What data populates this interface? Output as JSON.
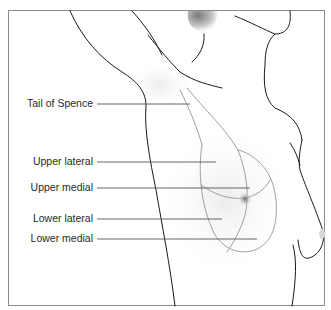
{
  "diagram": {
    "labels": [
      {
        "id": "tail-of-spence",
        "text": "Tail of Spence",
        "text_right": 93,
        "y": 102,
        "line_to_x": 190,
        "line_y": 104
      },
      {
        "id": "upper-lateral",
        "text": "Upper lateral",
        "text_right": 93,
        "y": 156,
        "line_to_x": 216,
        "line_y": 162
      },
      {
        "id": "upper-medial",
        "text": "Upper medial",
        "text_right": 93,
        "y": 182,
        "line_to_x": 250,
        "line_y": 188
      },
      {
        "id": "lower-lateral",
        "text": "Lower lateral",
        "text_right": 93,
        "y": 213,
        "line_to_x": 222,
        "line_y": 219
      },
      {
        "id": "lower-medial",
        "text": "Lower medial",
        "text_right": 93,
        "y": 233,
        "line_to_x": 257,
        "line_y": 239
      }
    ],
    "colors": {
      "outline": "#1a1a1a",
      "quadrant_lines": "#a0a0a0",
      "leader_lines": "#555555",
      "frame": "#8a8a8a",
      "label_text": "#2a2a2a"
    }
  }
}
